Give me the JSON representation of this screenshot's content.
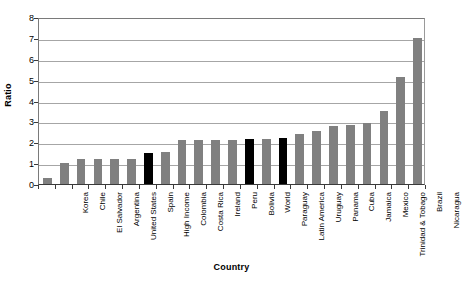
{
  "chart_data": {
    "type": "bar",
    "title": "",
    "xlabel": "Country",
    "ylabel": "Ratio",
    "ylim": [
      0,
      8
    ],
    "ytick_values": [
      0,
      1,
      2,
      3,
      4,
      5,
      6,
      7,
      8
    ],
    "ytick_labels": [
      "0",
      "1",
      "2",
      "3",
      "4",
      "5",
      "6",
      "7",
      "8"
    ],
    "grid": true,
    "legend": "none",
    "categories": [
      "Korea",
      "Chile",
      "El Salvador",
      "Argentina",
      "United States",
      "Spain",
      "High Income",
      "Colombia",
      "Costa Rica",
      "Ireland",
      "Peru",
      "Bolivia",
      "World",
      "Paraguay",
      "Latin America",
      "Uruguay",
      "Panama",
      "Cuba",
      "Jamaica",
      "Mexico",
      "Trinidad & Tobago",
      "Brazil",
      "Nicaragua"
    ],
    "values": [
      0.3,
      1.0,
      1.2,
      1.2,
      1.2,
      1.2,
      1.5,
      1.55,
      2.1,
      2.1,
      2.1,
      2.1,
      2.15,
      2.15,
      2.2,
      2.4,
      2.55,
      2.8,
      2.85,
      2.9,
      3.5,
      5.15,
      7.0
    ],
    "bar_colors": [
      "#808080",
      "#808080",
      "#808080",
      "#808080",
      "#808080",
      "#808080",
      "#000000",
      "#808080",
      "#808080",
      "#808080",
      "#808080",
      "#808080",
      "#000000",
      "#808080",
      "#000000",
      "#808080",
      "#808080",
      "#808080",
      "#808080",
      "#808080",
      "#808080",
      "#808080",
      "#808080"
    ],
    "highlight_color": "#000000",
    "series_color": "#808080",
    "gridline_color": "#a6a6a6",
    "axis_color": "#3a3a3a"
  }
}
